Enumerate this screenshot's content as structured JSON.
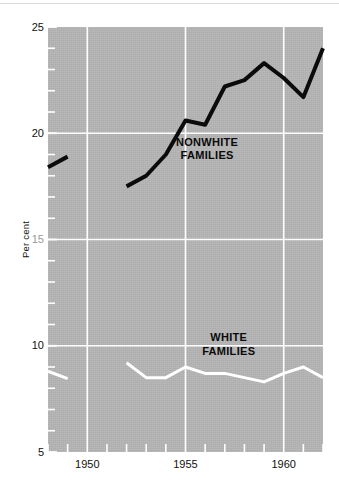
{
  "chart_data": {
    "type": "line",
    "title": "",
    "subtitle": "",
    "xlabel": "",
    "ylabel": "Per cent",
    "xlim": [
      1948,
      1962
    ],
    "ylim": [
      5,
      25
    ],
    "grid": true,
    "legend_position": "inline-annotation",
    "x_ticks": [
      1950,
      1955,
      1960
    ],
    "x_tick_labels": [
      "1950",
      "1955",
      "1960"
    ],
    "x_minor_tick_step": 1,
    "y_ticks": [
      5,
      10,
      15,
      20,
      25
    ],
    "y_tick_labels": [
      "5",
      "10",
      "15",
      "20",
      "25"
    ],
    "y_minor_tick_step": 1,
    "plot_background_color": "#b4b4b4",
    "series": [
      {
        "name": "NONWHITE FAMILIES",
        "color": "#0b0b0b",
        "line_width": 4,
        "annotation": "NONWHITE\nFAMILIES",
        "segments": [
          {
            "x": [
              1948,
              1949
            ],
            "values": [
              18.4,
              18.9
            ]
          },
          {
            "x": [
              1952,
              1953,
              1954,
              1955,
              1956,
              1957,
              1958,
              1959,
              1960,
              1961,
              1962
            ],
            "values": [
              17.5,
              18.0,
              19.0,
              20.6,
              20.4,
              22.2,
              22.5,
              23.3,
              22.6,
              21.7,
              24.0
            ]
          }
        ]
      },
      {
        "name": "WHITE FAMILIES",
        "color": "#ffffff",
        "line_width": 3,
        "annotation": "WHITE\nFAMILIES",
        "segments": [
          {
            "x": [
              1948,
              1949
            ],
            "values": [
              8.8,
              8.45
            ]
          },
          {
            "x": [
              1952,
              1953,
              1954,
              1955,
              1956,
              1957,
              1958,
              1959,
              1960,
              1961,
              1962
            ],
            "values": [
              9.2,
              8.5,
              8.5,
              9.0,
              8.7,
              8.7,
              8.5,
              8.3,
              8.7,
              9.0,
              8.5
            ]
          }
        ]
      }
    ]
  },
  "annotations": {
    "nonwhite": {
      "line1": "NONWHITE",
      "line2": "FAMILIES"
    },
    "white": {
      "line1": "WHITE",
      "line2": "FAMILIES"
    }
  },
  "axis": {
    "y_title": "Per cent"
  }
}
